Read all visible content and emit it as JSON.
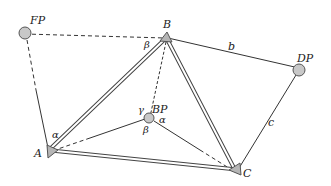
{
  "diagram": {
    "points": {
      "FP": "FP",
      "B": "B",
      "DP": "DP",
      "BP": "BP",
      "A": "A",
      "C": "C"
    },
    "sides": {
      "b": "b",
      "c": "c"
    },
    "angles": {
      "alpha_A": "α",
      "beta_B": "β",
      "gamma_BP": "γ",
      "alpha_BP": "α",
      "beta_BP": "β"
    },
    "legend": {
      "FP": "fixed point (circle)",
      "DP": "fixed point (circle)",
      "BP": "new point (circle)",
      "A": "triangulation station (triangle)",
      "B": "triangulation station (triangle)",
      "C": "triangulation station (triangle)"
    }
  }
}
